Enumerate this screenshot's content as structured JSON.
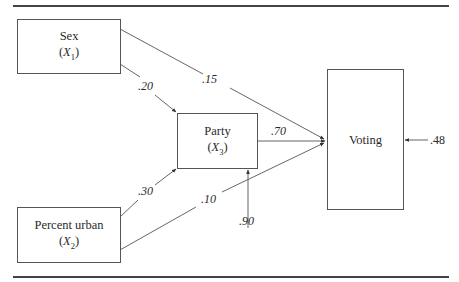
{
  "diagram": {
    "type": "path-diagram",
    "nodes": {
      "sex": {
        "label": "Sex",
        "var_open": "(",
        "var": "X",
        "sub": "1",
        "var_close": ")"
      },
      "party": {
        "label": "Party",
        "var_open": "(",
        "var": "X",
        "sub": "3",
        "var_close": ")"
      },
      "urban": {
        "label": "Percent urban",
        "var_open": "(",
        "var": "X",
        "sub": "2",
        "var_close": ")"
      },
      "voting": {
        "label": "Voting"
      }
    },
    "paths": {
      "sex_to_party": ".20",
      "sex_to_voting": ".15",
      "urban_to_party": ".30",
      "urban_to_voting": ".10",
      "party_to_voting": ".70",
      "party_residual": ".90",
      "voting_residual": ".48"
    },
    "colors": {
      "line": "#444444",
      "text": "#2a2a2a",
      "background": "#ffffff"
    }
  }
}
